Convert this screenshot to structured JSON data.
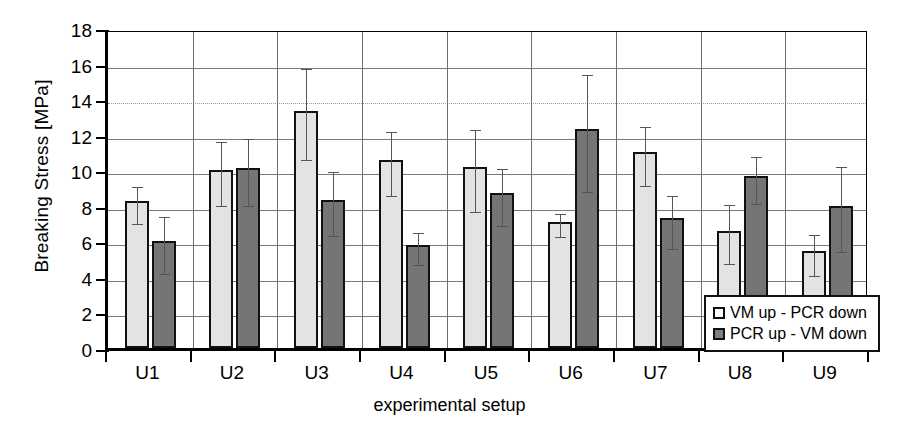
{
  "chart_data": {
    "type": "bar",
    "title": "",
    "xlabel": "experimental setup",
    "ylabel": "Breaking Stress   [MPa]",
    "ylim": [
      0,
      18
    ],
    "ytick_step": 2,
    "yticks": [
      "18",
      "16",
      "14",
      "12",
      "10",
      "8",
      "6",
      "4",
      "2",
      "0"
    ],
    "grid": true,
    "legend_position": "bottom-right",
    "categories": [
      "U1",
      "U2",
      "U3",
      "U4",
      "U5",
      "U6",
      "U7",
      "U8",
      "U9"
    ],
    "series": [
      {
        "name": "VM up - PCR down",
        "color": "#e3e3e3",
        "values": [
          8.25,
          10.0,
          13.35,
          10.6,
          10.2,
          7.1,
          11.0,
          6.6,
          5.45
        ],
        "err_low": [
          1.05,
          1.8,
          2.55,
          1.8,
          2.3,
          0.65,
          1.65,
          1.65,
          1.15
        ],
        "err_high": [
          1.05,
          1.8,
          2.55,
          1.8,
          2.3,
          0.65,
          1.65,
          1.65,
          1.15
        ]
      },
      {
        "name": "PCR up - VM down",
        "color": "#757575",
        "values": [
          6.0,
          10.1,
          8.3,
          5.8,
          8.7,
          12.3,
          7.3,
          9.65,
          8.0
        ],
        "err_low": [
          1.6,
          1.9,
          1.8,
          0.9,
          1.6,
          3.3,
          1.5,
          1.3,
          2.4
        ],
        "err_high": [
          1.6,
          1.9,
          1.8,
          0.9,
          1.6,
          3.3,
          1.5,
          1.3,
          2.4
        ]
      }
    ]
  },
  "legend": {
    "items": [
      {
        "label": "VM up - PCR down",
        "swatch": "light-swatch"
      },
      {
        "label": "PCR up - VM down",
        "swatch": "dark-swatch"
      }
    ]
  }
}
